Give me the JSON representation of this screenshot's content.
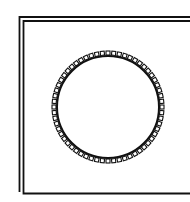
{
  "diagram": {
    "colors": {
      "background": "#ffffff",
      "stroke": "#111111"
    },
    "plate": {
      "outer_border": {
        "left": 19,
        "top": 16,
        "bottom": 191
      },
      "inner_border": {
        "left": 23,
        "top": 20,
        "bottom": 193
      }
    },
    "gear_ring": {
      "center_x": 108,
      "center_y": 107,
      "circle_radius": 51,
      "tooth_count": 60,
      "tooth_size": 4
    }
  }
}
